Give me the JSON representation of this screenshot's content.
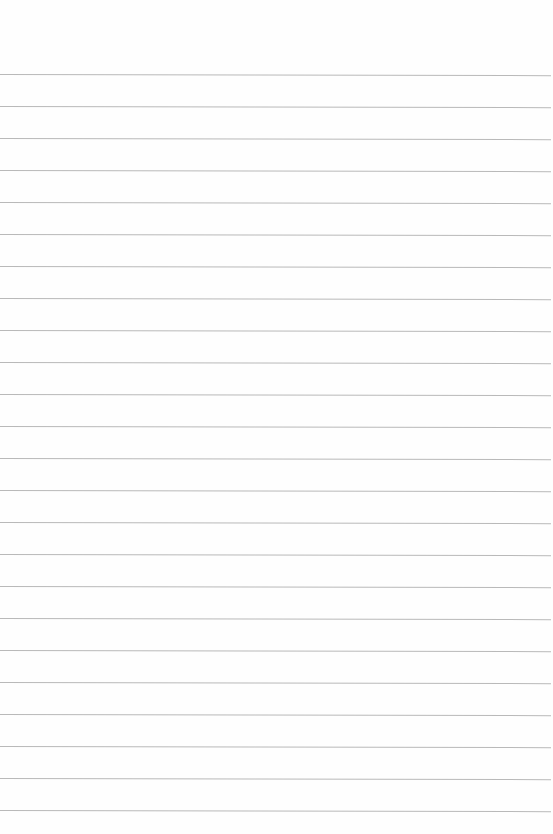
{
  "page": {
    "type": "ruled-paper",
    "background_color": "#fefefe",
    "line_color": "#b9b9b9",
    "first_line_y": 74,
    "line_spacing": 32,
    "line_count": 24,
    "content": ""
  }
}
